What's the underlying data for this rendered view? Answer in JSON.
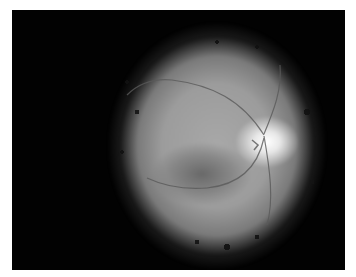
{
  "image": {
    "subject": "retinal fundus photograph (grayscale)",
    "features": [
      "optic-disc",
      "macula",
      "retinal-vessels",
      "dark-peripheral-border"
    ],
    "colors": {
      "background": "#020202",
      "retina": "#a0a0a0",
      "optic_disc": "#ffffff",
      "macula": "#6a6a6a",
      "page": "#ffffff"
    }
  }
}
